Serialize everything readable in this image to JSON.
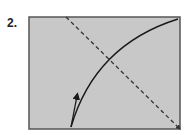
{
  "figure": {
    "label": "2.",
    "background": "#c8c8c8",
    "border_color": "#555555",
    "line_color": "#1a1a1a"
  },
  "elements": {
    "box": {
      "x": 29,
      "y": 17,
      "width": 151,
      "height": 112
    },
    "dashed_line": {
      "x1": 66,
      "y1": 17,
      "x2": 180,
      "y2": 129
    },
    "curve": {
      "start": [
        71,
        127
      ],
      "control": [
        95,
        45
      ],
      "end": [
        178,
        19
      ]
    },
    "arrow": {
      "x1": 71,
      "y1": 127,
      "x2": 78,
      "y2": 93
    }
  }
}
